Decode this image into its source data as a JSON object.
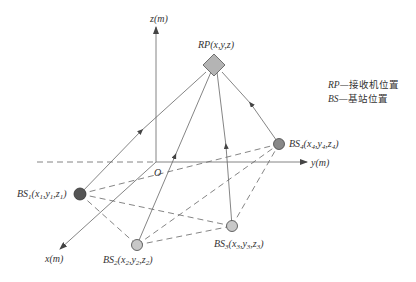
{
  "axes": {
    "z_label": "z(m)",
    "y_label": "y(m)",
    "x_label": "x(m)",
    "origin_label": "O"
  },
  "receiver": {
    "label": "RP(x,y,z)",
    "shape": "diamond",
    "fill": "#b4b4b4"
  },
  "base_stations": [
    {
      "id": "BS1",
      "name": "BS",
      "index": "1",
      "coords": [
        "x",
        "1",
        "y",
        "1",
        "z",
        "1"
      ],
      "fill": "#555555"
    },
    {
      "id": "BS2",
      "name": "BS",
      "index": "2",
      "coords": [
        "x",
        "2",
        "y",
        "2",
        "z",
        "2"
      ],
      "fill": "#c8c8c8"
    },
    {
      "id": "BS3",
      "name": "BS",
      "index": "3",
      "coords": [
        "x",
        "3",
        "y",
        "3",
        "z",
        "3"
      ],
      "fill": "#c8c8c8"
    },
    {
      "id": "BS4",
      "name": "BS",
      "index": "4",
      "coords": [
        "x",
        "4",
        "y",
        "4",
        "z",
        "4"
      ],
      "fill": "#888888"
    }
  ],
  "legend": [
    {
      "abbr": "RP",
      "dash": "—",
      "text": "接收机位置"
    },
    {
      "abbr": "BS",
      "dash": "—",
      "text": "基站位置"
    }
  ],
  "colors": {
    "line": "#666666",
    "text": "#333333"
  }
}
